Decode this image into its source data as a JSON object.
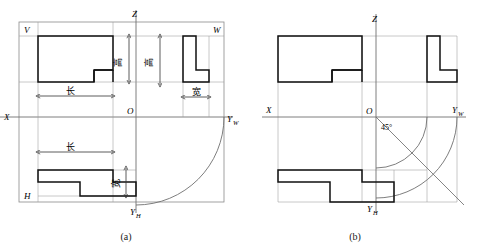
{
  "figure": {
    "panels": [
      {
        "id": "a",
        "caption": "(a)",
        "axis_labels": {
          "z": "Z",
          "x": "X",
          "origin": "O",
          "y_w": "Y",
          "y_w_sub": "W",
          "y_h": "Y",
          "y_h_sub": "H"
        },
        "quadrant_labels": {
          "v": "V",
          "w": "W",
          "h": "H"
        },
        "dimension_labels": {
          "length_front": "长",
          "length_top": "长",
          "height_front": "高",
          "height_side": "高",
          "width_side": "宽",
          "width_top": "宽"
        }
      },
      {
        "id": "b",
        "caption": "(b)",
        "axis_labels": {
          "z": "Z",
          "x": "X",
          "origin": "O",
          "y_w": "Y",
          "y_w_sub": "W",
          "y_h": "Y",
          "y_h_sub": "H"
        },
        "angle_label": "45°"
      }
    ],
    "colors": {
      "outline": "#111111",
      "thin_line": "#777777",
      "background": "#ffffff",
      "dimension_line": "#333333"
    }
  }
}
